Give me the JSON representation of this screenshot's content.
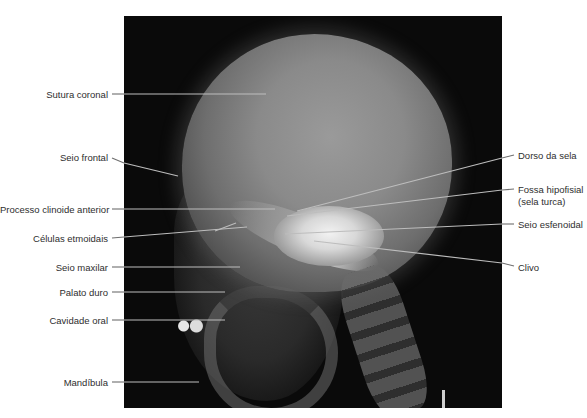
{
  "figure": {
    "type": "lateral-skull-radiograph",
    "background_color": "#ffffff",
    "panel_color": "#0a0a0a",
    "leader_color_left": "#6a6a6a",
    "leader_color_right": "#bdbdbd"
  },
  "labels_left": [
    {
      "id": "sutura-coronal",
      "text": "Sutura coronal"
    },
    {
      "id": "seio-frontal",
      "text": "Seio frontal"
    },
    {
      "id": "processo-clinoide-anterior",
      "text": "Processo clinoide anterior"
    },
    {
      "id": "celulas-etmoidais",
      "text": "Células etmoidais"
    },
    {
      "id": "seio-maxilar",
      "text": "Seio maxilar"
    },
    {
      "id": "palato-duro",
      "text": "Palato duro"
    },
    {
      "id": "cavidade-oral",
      "text": "Cavidade oral"
    },
    {
      "id": "mandibula",
      "text": "Mandíbula"
    }
  ],
  "labels_right": [
    {
      "id": "dorso-da-sela",
      "text": "Dorso da sela"
    },
    {
      "id": "fossa-hipofisial",
      "text": "Fossa hipofisial",
      "text2": "(sela turca)"
    },
    {
      "id": "seio-esfenoidal",
      "text": "Seio esfenoidal"
    },
    {
      "id": "clivo",
      "text": "Clivo"
    }
  ]
}
